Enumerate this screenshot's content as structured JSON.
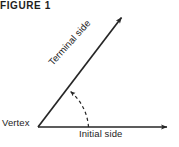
{
  "figure": {
    "caption": "FIGURE 1",
    "background_color": "#ffffff",
    "stroke_color": "#262626",
    "text_color": "#1d1d1d",
    "width": 179,
    "height": 147,
    "labels": {
      "vertex": "Vertex",
      "initial_side": "Initial side",
      "terminal_side": "Terminal side"
    },
    "geometry": {
      "vertex_point": [
        38,
        127
      ],
      "initial_ray_end": [
        172,
        127
      ],
      "terminal_ray_end": [
        118,
        13
      ],
      "terminal_ray_angle_degrees": 55,
      "arc_style": "dashed",
      "arc_start": [
        88,
        127
      ],
      "arc_end": [
        68,
        88
      ],
      "arc_direction": "counterclockwise",
      "terminal_label_rotation_degrees": -48
    }
  }
}
